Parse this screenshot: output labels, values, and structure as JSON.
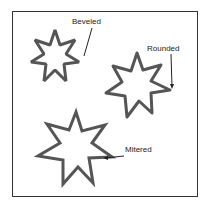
{
  "diagram": {
    "labels": {
      "beveled": "Beveled",
      "rounded": "Rounded",
      "mitered": "Mitered"
    },
    "stroke_color": "#555555",
    "border_color": "#333333"
  }
}
